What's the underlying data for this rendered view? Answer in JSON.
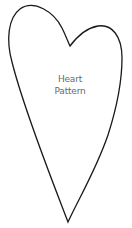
{
  "pattern": {
    "title_line1": "Heart",
    "title_line2": "Pattern",
    "stroke_color": "#1a1a1a",
    "fill_color": "#ffffff",
    "text_color": "#6a6a6a"
  }
}
